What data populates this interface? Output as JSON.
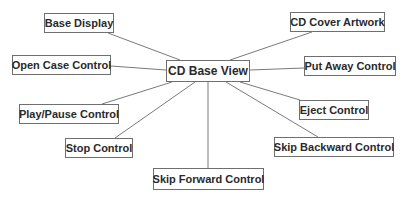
{
  "diagram": {
    "type": "hub-and-spoke",
    "center": {
      "id": "center",
      "label": "CD Base View",
      "x": 166,
      "y": 60,
      "w": 84,
      "h": 22
    },
    "nodes": [
      {
        "id": "base-display",
        "label": "Base Display",
        "x": 44,
        "y": 13,
        "w": 70,
        "h": 20
      },
      {
        "id": "cd-cover-artwork",
        "label": "CD Cover Artwork",
        "x": 290,
        "y": 12,
        "w": 95,
        "h": 20
      },
      {
        "id": "open-case-control",
        "label": "Open Case Control",
        "x": 12,
        "y": 55,
        "w": 99,
        "h": 20
      },
      {
        "id": "put-away-control",
        "label": "Put Away Control",
        "x": 304,
        "y": 56,
        "w": 92,
        "h": 20
      },
      {
        "id": "play-pause-control",
        "label": "Play/Pause Control",
        "x": 19,
        "y": 104,
        "w": 100,
        "h": 20
      },
      {
        "id": "eject-control",
        "label": "Eject Control",
        "x": 299,
        "y": 100,
        "w": 70,
        "h": 20
      },
      {
        "id": "stop-control",
        "label": "Stop Control",
        "x": 65,
        "y": 138,
        "w": 68,
        "h": 20
      },
      {
        "id": "skip-backward-control",
        "label": "Skip Backward Control",
        "x": 274,
        "y": 137,
        "w": 120,
        "h": 20
      },
      {
        "id": "skip-forward-control",
        "label": "Skip Forward Control",
        "x": 153,
        "y": 168,
        "w": 111,
        "h": 22
      }
    ],
    "edges": [
      {
        "from": "center",
        "to": "base-display",
        "x1": 180,
        "y1": 60,
        "x2": 108,
        "y2": 33
      },
      {
        "from": "center",
        "to": "cd-cover-artwork",
        "x1": 230,
        "y1": 60,
        "x2": 312,
        "y2": 32
      },
      {
        "from": "center",
        "to": "open-case-control",
        "x1": 166,
        "y1": 70,
        "x2": 111,
        "y2": 66
      },
      {
        "from": "center",
        "to": "put-away-control",
        "x1": 250,
        "y1": 70,
        "x2": 304,
        "y2": 68
      },
      {
        "from": "center",
        "to": "play-pause-control",
        "x1": 172,
        "y1": 82,
        "x2": 102,
        "y2": 104
      },
      {
        "from": "center",
        "to": "eject-control",
        "x1": 240,
        "y1": 82,
        "x2": 300,
        "y2": 100
      },
      {
        "from": "center",
        "to": "stop-control",
        "x1": 195,
        "y1": 82,
        "x2": 115,
        "y2": 138
      },
      {
        "from": "center",
        "to": "skip-backward-control",
        "x1": 226,
        "y1": 82,
        "x2": 318,
        "y2": 137
      },
      {
        "from": "center",
        "to": "skip-forward-control",
        "x1": 208,
        "y1": 82,
        "x2": 208,
        "y2": 168
      }
    ],
    "colors": {
      "line": "#7a7a7a",
      "border": "#6f6f6f",
      "text": "#2a2a2a",
      "background": "#ffffff"
    }
  }
}
